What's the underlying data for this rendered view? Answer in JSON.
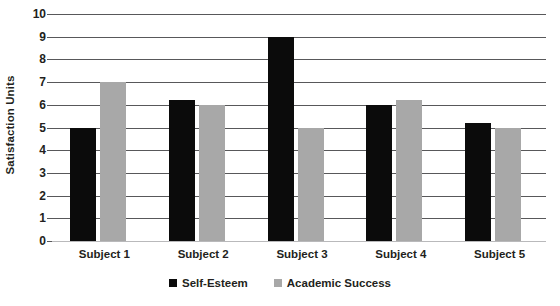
{
  "chart_data": {
    "type": "bar",
    "title": "",
    "xlabel": "",
    "ylabel": "Satisfaction Units",
    "ylim": [
      0,
      10
    ],
    "ytick_step": 1,
    "grid": true,
    "legend_position": "bottom",
    "categories": [
      "Subject 1",
      "Subject 2",
      "Subject 3",
      "Subject 4",
      "Subject 5"
    ],
    "yticks": [
      "10",
      "9",
      "8",
      "7",
      "6",
      "5",
      "4",
      "3",
      "2",
      "1",
      "0"
    ],
    "series": [
      {
        "name": "Self-Esteem",
        "color": "#0b0b0b",
        "values": [
          5.0,
          6.2,
          9.0,
          6.0,
          5.2
        ]
      },
      {
        "name": "Academic Success",
        "color": "#a8a8a8",
        "values": [
          7.0,
          6.0,
          5.0,
          6.2,
          5.0
        ]
      }
    ]
  },
  "axis": {
    "y_title": "Satisfaction Units"
  },
  "legend": {
    "items": [
      {
        "label": "Self-Esteem",
        "color": "#0b0b0b"
      },
      {
        "label": "Academic Success",
        "color": "#a8a8a8"
      }
    ]
  }
}
